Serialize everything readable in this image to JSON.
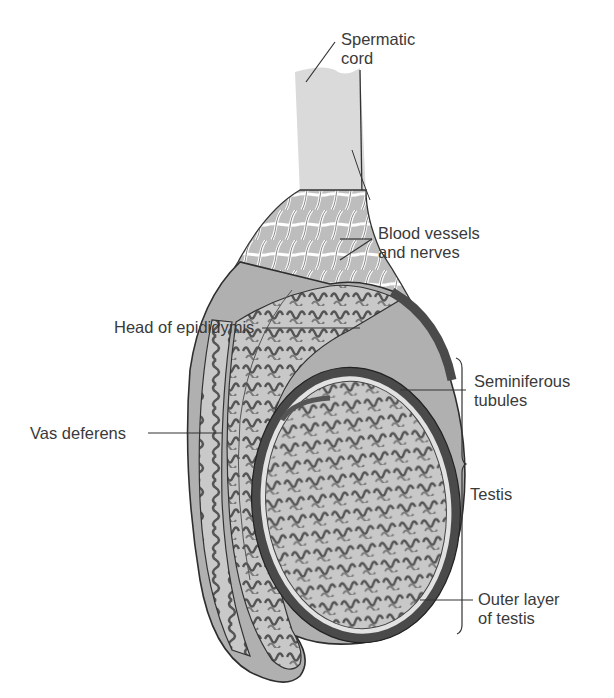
{
  "figure": {
    "labels": {
      "spermatic_cord": "Spermatic\ncord",
      "blood_vessels": "Blood vessels\nand nerves",
      "head_epididymis": "Head of epididymis",
      "vas_deferens": "Vas deferens",
      "seminiferous": "Seminiferous\ntubules",
      "testis": "Testis",
      "outer_layer": "Outer layer\nof testis"
    },
    "colors": {
      "background": "#ffffff",
      "cord_fill": "#d9d9d9",
      "tissue_light": "#c4c4c4",
      "tissue_mid": "#9a9a9a",
      "tissue_dark": "#5a5a5a",
      "outline": "#2e2e2e",
      "leader_line": "#333333",
      "text": "#3a3a3a"
    }
  }
}
